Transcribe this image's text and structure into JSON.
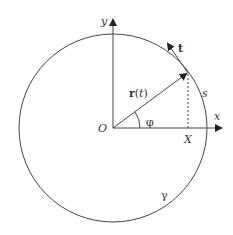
{
  "diagram": {
    "labels": {
      "y_axis": "y",
      "x_axis": "x",
      "origin": "O",
      "tangent": "t",
      "position_vector": "r(t)",
      "arc_length": "s",
      "angle": "φ",
      "projection": "X",
      "curve": "γ"
    }
  }
}
